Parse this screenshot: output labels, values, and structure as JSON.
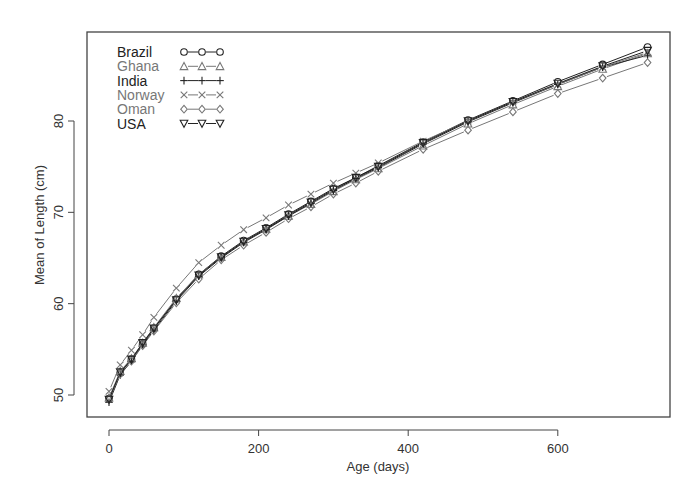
{
  "chart_data": {
    "type": "line",
    "title": "",
    "xlabel": "Age (days)",
    "ylabel": "Mean of Length (cm)",
    "xlim": [
      -25,
      755
    ],
    "ylim": [
      48.5,
      89.5
    ],
    "xticks": [
      0,
      200,
      400,
      600
    ],
    "yticks": [
      50,
      60,
      70,
      80
    ],
    "grid": false,
    "legend_position": "top-left",
    "x": [
      0,
      15,
      30,
      45,
      60,
      90,
      120,
      150,
      180,
      210,
      240,
      270,
      300,
      330,
      360,
      420,
      480,
      540,
      600,
      660,
      720
    ],
    "series": [
      {
        "name": "Brazil",
        "marker": "circle",
        "color": "#222222",
        "values": [
          49.6,
          52.4,
          53.9,
          55.6,
          57.3,
          60.5,
          63.2,
          65.2,
          66.9,
          68.3,
          69.8,
          71.2,
          72.6,
          73.8,
          75.1,
          77.7,
          80.1,
          82.2,
          84.3,
          86.2,
          88.1
        ]
      },
      {
        "name": "Ghana",
        "marker": "triangle",
        "color": "#777777",
        "values": [
          49.7,
          52.6,
          54.0,
          55.7,
          57.4,
          60.6,
          63.2,
          65.1,
          66.8,
          68.2,
          69.6,
          70.9,
          72.3,
          73.6,
          74.8,
          77.3,
          79.7,
          81.8,
          83.8,
          85.7,
          87.4
        ]
      },
      {
        "name": "India",
        "marker": "plus",
        "color": "#222222",
        "values": [
          49.2,
          52.2,
          53.7,
          55.5,
          57.1,
          60.3,
          63.0,
          65.0,
          66.7,
          68.1,
          69.6,
          71.0,
          72.4,
          73.7,
          74.9,
          77.5,
          79.9,
          82.0,
          84.0,
          85.9,
          87.2
        ]
      },
      {
        "name": "Norway",
        "marker": "x",
        "color": "#777777",
        "values": [
          50.4,
          53.3,
          54.9,
          56.6,
          58.5,
          61.7,
          64.5,
          66.4,
          68.1,
          69.4,
          70.8,
          72.0,
          73.2,
          74.3,
          75.4,
          77.8,
          80.0,
          82.1,
          84.0,
          85.9,
          87.5
        ]
      },
      {
        "name": "Oman",
        "marker": "diamond",
        "color": "#777777",
        "values": [
          49.5,
          52.3,
          53.7,
          55.4,
          57.0,
          60.1,
          62.7,
          64.8,
          66.4,
          67.8,
          69.3,
          70.6,
          72.0,
          73.2,
          74.5,
          76.9,
          79.0,
          81.0,
          83.0,
          84.7,
          86.4
        ]
      },
      {
        "name": "USA",
        "marker": "triangle-down",
        "color": "#222222",
        "values": [
          49.5,
          52.5,
          53.9,
          55.7,
          57.3,
          60.4,
          63.1,
          65.1,
          66.8,
          68.2,
          69.7,
          71.1,
          72.5,
          73.8,
          75.0,
          77.6,
          80.0,
          82.1,
          84.1,
          86.0,
          87.7
        ]
      }
    ]
  },
  "plot_area": {
    "left": 87,
    "top": 32,
    "right": 670,
    "bottom": 417
  },
  "legend": {
    "entries": [
      {
        "label": "Brazil",
        "symbol": "o-o-o",
        "color": "#222222"
      },
      {
        "label": "Ghana",
        "symbol": "△-△-△",
        "color": "#777777"
      },
      {
        "label": "India",
        "symbol": "+-+-+",
        "color": "#222222"
      },
      {
        "label": "Norway",
        "symbol": "×-×-×",
        "color": "#777777"
      },
      {
        "label": "Oman",
        "symbol": "◇-◇-◇",
        "color": "#777777"
      },
      {
        "label": "USA",
        "symbol": "▽-▽-▽",
        "color": "#222222"
      }
    ]
  }
}
